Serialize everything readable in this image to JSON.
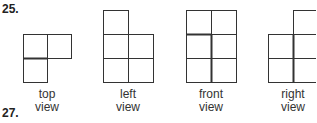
{
  "problems": {
    "first": "25.",
    "second": "27."
  },
  "views": [
    {
      "id": "top",
      "line1": "top",
      "line2": "view"
    },
    {
      "id": "left",
      "line1": "left",
      "line2": "view"
    },
    {
      "id": "front",
      "line1": "front",
      "line2": "view"
    },
    {
      "id": "right",
      "line1": "right",
      "line2": "view"
    }
  ]
}
